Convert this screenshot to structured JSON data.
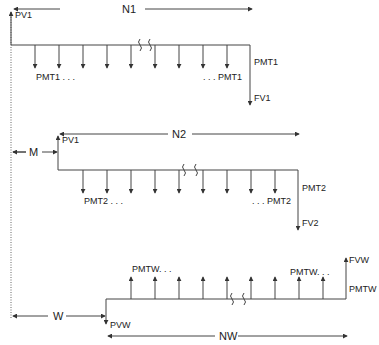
{
  "diagram": {
    "type": "cash-flow-timeline",
    "timelines": [
      {
        "id": "timeline-1",
        "period_label": "N1",
        "present_value_label": "PV1",
        "payment_label_start": "PMT1 . . .",
        "payment_label_end": ". . . PMT1",
        "final_payment_label": "PMT1",
        "future_value_label": "FV1",
        "payment_direction": "down"
      },
      {
        "id": "timeline-2",
        "offset_label": "M",
        "period_label": "N2",
        "present_value_label": "PV1",
        "payment_label_start": "PMT2 . . .",
        "payment_label_end": ". . . PMT2",
        "final_payment_label": "PMT2",
        "future_value_label": "FV2",
        "payment_direction": "down"
      },
      {
        "id": "timeline-w",
        "offset_label": "W",
        "period_label": "NW",
        "present_value_label": "PVW",
        "payment_label_start": "PMTW. . .",
        "payment_label_end": "PMTW. . .",
        "final_payment_label": "PMTW",
        "future_value_label": "FVW",
        "payment_direction": "up"
      }
    ]
  }
}
